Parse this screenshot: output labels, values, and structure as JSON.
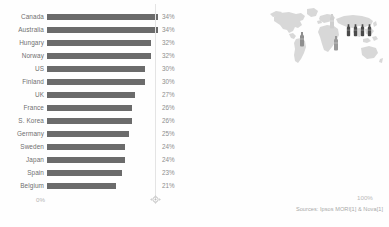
{
  "chart_data": {
    "type": "bar",
    "title": "",
    "subtitle": "",
    "xlabel": "",
    "ylabel": "",
    "orientation": "horizontal",
    "grid": true,
    "gridlines": [
      34
    ],
    "legend": "none",
    "xlim": [
      0,
      100
    ],
    "axis_ticks": [
      "0%",
      "100%"
    ],
    "categories": [
      "Canada",
      "Australia",
      "Hungary",
      "Norway",
      "US",
      "Finland",
      "UK",
      "France",
      "S. Korea",
      "Germany",
      "Sweden",
      "Japan",
      "Spain",
      "Belgium"
    ],
    "values": [
      34,
      34,
      32,
      32,
      30,
      30,
      27,
      26,
      26,
      25,
      24,
      24,
      23,
      21
    ],
    "value_labels": [
      "34%",
      "34%",
      "32%",
      "32%",
      "30%",
      "30%",
      "27%",
      "26%",
      "26%",
      "25%",
      "24%",
      "24%",
      "23%",
      "21%"
    ],
    "bar_color": "#6b6b6b",
    "gridline_color": "#e4e4e4"
  },
  "axis": {
    "min_label": "0%",
    "max_label": "100%"
  },
  "map": {
    "name": "world-map",
    "land_color": "#d7d7d7",
    "pins": [
      {
        "name": "map-pin-north-america",
        "x": 34,
        "y": 26,
        "shade": "#8f8f8f",
        "size": "large"
      },
      {
        "name": "map-pin-europe-north",
        "x": 64,
        "y": 8,
        "shade": "#cfcfcf",
        "size": "large"
      },
      {
        "name": "map-pin-africa",
        "x": 68,
        "y": 30,
        "shade": "#9a9a9a",
        "size": "large"
      },
      {
        "name": "map-pin-asia-1",
        "x": 81,
        "y": 17,
        "shade": "#4a4a4a",
        "size": "small"
      },
      {
        "name": "map-pin-asia-2",
        "x": 88,
        "y": 17,
        "shade": "#4a4a4a",
        "size": "small"
      },
      {
        "name": "map-pin-asia-3",
        "x": 95,
        "y": 17,
        "shade": "#4a4a4a",
        "size": "small"
      },
      {
        "name": "map-pin-asia-4",
        "x": 102,
        "y": 17,
        "shade": "#4a4a4a",
        "size": "small"
      }
    ]
  },
  "footer": {
    "source": "Sources: Ipsos MORI[1] & Nova[1]"
  }
}
